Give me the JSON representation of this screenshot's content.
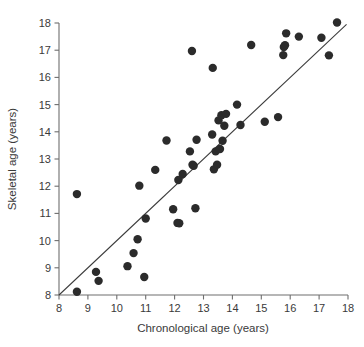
{
  "chart_data": {
    "type": "scatter",
    "title": "",
    "xlabel": "Chronological age (years)",
    "ylabel": "Skeletal age (years)",
    "xlim": [
      8,
      18
    ],
    "ylim": [
      8,
      18
    ],
    "xticks": [
      8,
      9,
      10,
      11,
      12,
      13,
      14,
      15,
      16,
      17,
      18
    ],
    "yticks": [
      8,
      9,
      10,
      11,
      12,
      13,
      14,
      15,
      16,
      17,
      18
    ],
    "xtick_labels": [
      "8",
      "9",
      "10",
      "11",
      "12",
      "13",
      "14",
      "15",
      "16",
      "17",
      "18"
    ],
    "ytick_labels": [
      "8",
      "9",
      "10",
      "11",
      "12",
      "13",
      "14",
      "15",
      "16",
      "17",
      "18"
    ],
    "grid": false,
    "legend": null,
    "marker": "filled-circle",
    "marker_color": "#2b2b2b",
    "marker_size": 4.2,
    "series": [
      {
        "name": "subjects",
        "points": [
          [
            8.62,
            8.12
          ],
          [
            8.62,
            11.71
          ],
          [
            9.28,
            8.85
          ],
          [
            9.37,
            8.52
          ],
          [
            10.37,
            9.06
          ],
          [
            10.58,
            9.54
          ],
          [
            10.72,
            10.05
          ],
          [
            10.78,
            12.02
          ],
          [
            10.95,
            8.66
          ],
          [
            11.0,
            10.81
          ],
          [
            11.33,
            12.6
          ],
          [
            11.72,
            13.68
          ],
          [
            11.95,
            11.15
          ],
          [
            12.1,
            10.65
          ],
          [
            12.16,
            10.64
          ],
          [
            12.13,
            12.23
          ],
          [
            12.28,
            12.45
          ],
          [
            12.53,
            13.28
          ],
          [
            12.6,
            16.97
          ],
          [
            12.62,
            12.79
          ],
          [
            12.66,
            12.75
          ],
          [
            12.72,
            11.19
          ],
          [
            12.76,
            13.71
          ],
          [
            13.32,
            16.35
          ],
          [
            13.3,
            13.9
          ],
          [
            13.36,
            12.62
          ],
          [
            13.42,
            13.28
          ],
          [
            13.47,
            12.79
          ],
          [
            13.52,
            14.42
          ],
          [
            13.57,
            13.37
          ],
          [
            13.62,
            14.61
          ],
          [
            13.66,
            13.67
          ],
          [
            13.72,
            14.22
          ],
          [
            13.78,
            14.66
          ],
          [
            14.16,
            15.0
          ],
          [
            14.28,
            14.25
          ],
          [
            14.65,
            17.19
          ],
          [
            15.12,
            14.37
          ],
          [
            15.58,
            14.54
          ],
          [
            15.76,
            16.82
          ],
          [
            15.78,
            17.12
          ],
          [
            15.82,
            17.18
          ],
          [
            15.86,
            17.62
          ],
          [
            16.3,
            17.5
          ],
          [
            17.08,
            17.46
          ],
          [
            17.34,
            16.81
          ],
          [
            17.62,
            18.02
          ]
        ]
      }
    ],
    "fit_line": {
      "type": "identity",
      "x_start": 8.0,
      "y_start": 8.0,
      "x_end": 17.95,
      "y_end": 17.95,
      "color": "#3a3a3a"
    }
  }
}
